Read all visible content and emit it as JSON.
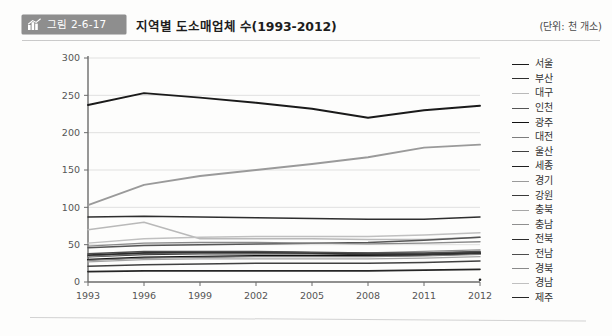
{
  "header": {
    "badge_label": "그림 2-6-17",
    "badge_icon": "bar-chart-icon",
    "badge_color": "#8e8e8e",
    "title": "지역별 도소매업체 수(1993-2012)",
    "unit": "(단위: 천 개소)"
  },
  "chart_data": {
    "type": "line",
    "title": "지역별 도소매업체 수(1993-2012)",
    "xlabel": "",
    "ylabel": "",
    "unit": "천 개소",
    "grid": true,
    "legend_position": "right",
    "ylim": [
      0,
      300
    ],
    "yticks": [
      0,
      50,
      100,
      150,
      200,
      250,
      300
    ],
    "categories": [
      "1993",
      "1996",
      "1999",
      "2002",
      "2005",
      "2008",
      "2011",
      "2012"
    ],
    "x": [
      1993,
      1996,
      1999,
      2002,
      2005,
      2008,
      2011,
      2012
    ],
    "series": [
      {
        "name": "서울",
        "color": "#1a1a1a",
        "width": 1.9,
        "values": [
          237,
          253,
          247,
          240,
          232,
          220,
          230,
          236
        ]
      },
      {
        "name": "부산",
        "color": "#2e2e2e",
        "width": 1.5,
        "values": [
          87,
          88,
          87,
          86,
          85,
          84,
          84,
          87
        ]
      },
      {
        "name": "대구",
        "color": "#b9b9b9",
        "width": 1.5,
        "values": [
          70,
          80,
          58,
          58,
          58,
          57,
          57,
          60
        ]
      },
      {
        "name": "인천",
        "color": "#555555",
        "width": 1.5,
        "values": [
          46,
          49,
          50,
          51,
          52,
          53,
          56,
          60
        ]
      },
      {
        "name": "광주",
        "color": "#111111",
        "width": 1.9,
        "values": [
          30,
          33,
          34,
          35,
          35,
          35,
          36,
          38
        ]
      },
      {
        "name": "대전",
        "color": "#7d7d7d",
        "width": 1.4,
        "values": [
          29,
          32,
          33,
          34,
          34,
          34,
          35,
          37
        ]
      },
      {
        "name": "울산",
        "color": "#404040",
        "width": 1.5,
        "values": [
          21,
          23,
          24,
          25,
          25,
          25,
          26,
          28
        ]
      },
      {
        "name": "세종",
        "color": "#1f1f1f",
        "width": 1.7,
        "values": [
          null,
          null,
          null,
          null,
          null,
          null,
          null,
          3
        ]
      },
      {
        "name": "경기",
        "color": "#9a9a9a",
        "width": 1.9,
        "values": [
          103,
          130,
          142,
          150,
          158,
          167,
          180,
          184
        ]
      },
      {
        "name": "강원",
        "color": "#3a3a3a",
        "width": 1.7,
        "values": [
          34,
          37,
          38,
          38,
          38,
          37,
          37,
          39
        ]
      },
      {
        "name": "충북",
        "color": "#a6a6a6",
        "width": 1.4,
        "values": [
          27,
          30,
          31,
          31,
          31,
          31,
          32,
          34
        ]
      },
      {
        "name": "충남",
        "color": "#8f8f8f",
        "width": 1.4,
        "values": [
          34,
          38,
          39,
          39,
          39,
          39,
          41,
          43
        ]
      },
      {
        "name": "전북",
        "color": "#2b2b2b",
        "width": 1.6,
        "values": [
          36,
          39,
          40,
          40,
          39,
          38,
          38,
          40
        ]
      },
      {
        "name": "전남",
        "color": "#4d4d4d",
        "width": 1.5,
        "values": [
          38,
          41,
          41,
          41,
          40,
          39,
          39,
          41
        ]
      },
      {
        "name": "경북",
        "color": "#8a8a8a",
        "width": 1.4,
        "values": [
          48,
          52,
          53,
          53,
          52,
          51,
          52,
          54
        ]
      },
      {
        "name": "경남",
        "color": "#c0c0c0",
        "width": 1.4,
        "values": [
          52,
          58,
          60,
          61,
          61,
          61,
          63,
          66
        ]
      },
      {
        "name": "제주",
        "color": "#262626",
        "width": 1.7,
        "values": [
          14,
          15,
          15,
          15,
          15,
          15,
          16,
          17
        ]
      }
    ]
  }
}
